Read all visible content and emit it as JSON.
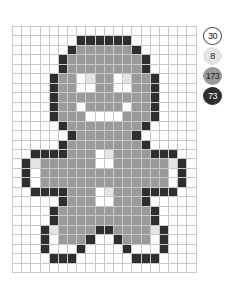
{
  "palette": [
    {
      "key": "W",
      "label": "30",
      "color": "#ffffff",
      "text_color": "#222222",
      "border": "#444444"
    },
    {
      "key": "L",
      "label": "8",
      "color": "#e4e4e4",
      "text_color": "#222222",
      "border": "#e4e4e4"
    },
    {
      "key": "G",
      "label": "173",
      "color": "#9a9a9a",
      "text_color": "#222222",
      "border": "#9a9a9a"
    },
    {
      "key": "D",
      "label": "73",
      "color": "#2e2e2e",
      "text_color": "#ffffff",
      "border": "#2e2e2e"
    }
  ],
  "grid": {
    "columns": 20,
    "rows": 26,
    "line_color": "#c8c8c8",
    "cells": [
      "WWWWWWWWWWWWWWWWWWWW",
      "WWWWWWWDDDDDDWWWWWWW",
      "WWWWWWDGGGGGGDWWWWWW",
      "WWWWWDGGGGGGGGDWWWWW",
      "WWWWWDGGGGGGGGDWWWWW",
      "WWWWDGGWLGGWLGGDWWWW",
      "WWWWDGGWWGGWWGGDWWWW",
      "WWWWDGGGGGGGGGGDWWWW",
      "WWWWDGGWGGGGWGGDWWWW",
      "WWWWDGGGWWWWGGGDWWWW",
      "WWWWWDGGGGGGGGDWWWWW",
      "WWWWWWDGGGGGGDWWWWWW",
      "WWWWWDGGGGGGGGDWWWWW",
      "WWDDDDGGGWLGGGGDDDWW",
      "WDLGGGGGGWWGGGGGGLDW",
      "WDWGGGGGGGGGGGGGGWDW",
      "WDWGGGGGGGGGGGGGGWDW",
      "WWDDDDGGGWLGGGDDDDWW",
      "WWWWWDGGGWWGGGDWWWWW",
      "WWWWDGGGGGGGGGGDWWWW",
      "WWWWDGGGGGGGGGGDWWWW",
      "WWWDLGGGGDDGGGGLDWWW",
      "WWWDWGGGDWWDGGGWDWWW",
      "WWWDWWWDWWWWDWWWDWWW",
      "WWWWDDDWWWWWWDDDWWWW",
      "WWWWWWWWWWWWWWWWWWWW"
    ]
  }
}
